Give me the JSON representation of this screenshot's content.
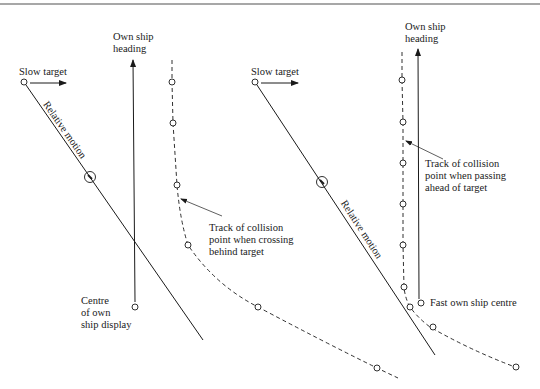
{
  "colors": {
    "ink": "#1a1a1a",
    "rule": "#8a8a8a",
    "background": "#ffffff"
  },
  "left_panel": {
    "own_ship_heading_label": [
      "Own ship",
      "heading"
    ],
    "slow_target_label": "Slow target",
    "relative_motion_label": "Relative motion",
    "collision_track_label": [
      "Track of collision",
      "point when crossing",
      "behind target"
    ],
    "own_ship_centre_label": [
      "Centre",
      "of own",
      "ship display"
    ]
  },
  "right_panel": {
    "own_ship_heading_label": [
      "Own ship",
      "heading"
    ],
    "slow_target_label": "Slow target",
    "relative_motion_label": "Relative motion",
    "collision_track_label": [
      "Track of collision",
      "point when passing",
      "ahead of target"
    ],
    "own_ship_centre_label": "Fast own ship centre"
  }
}
